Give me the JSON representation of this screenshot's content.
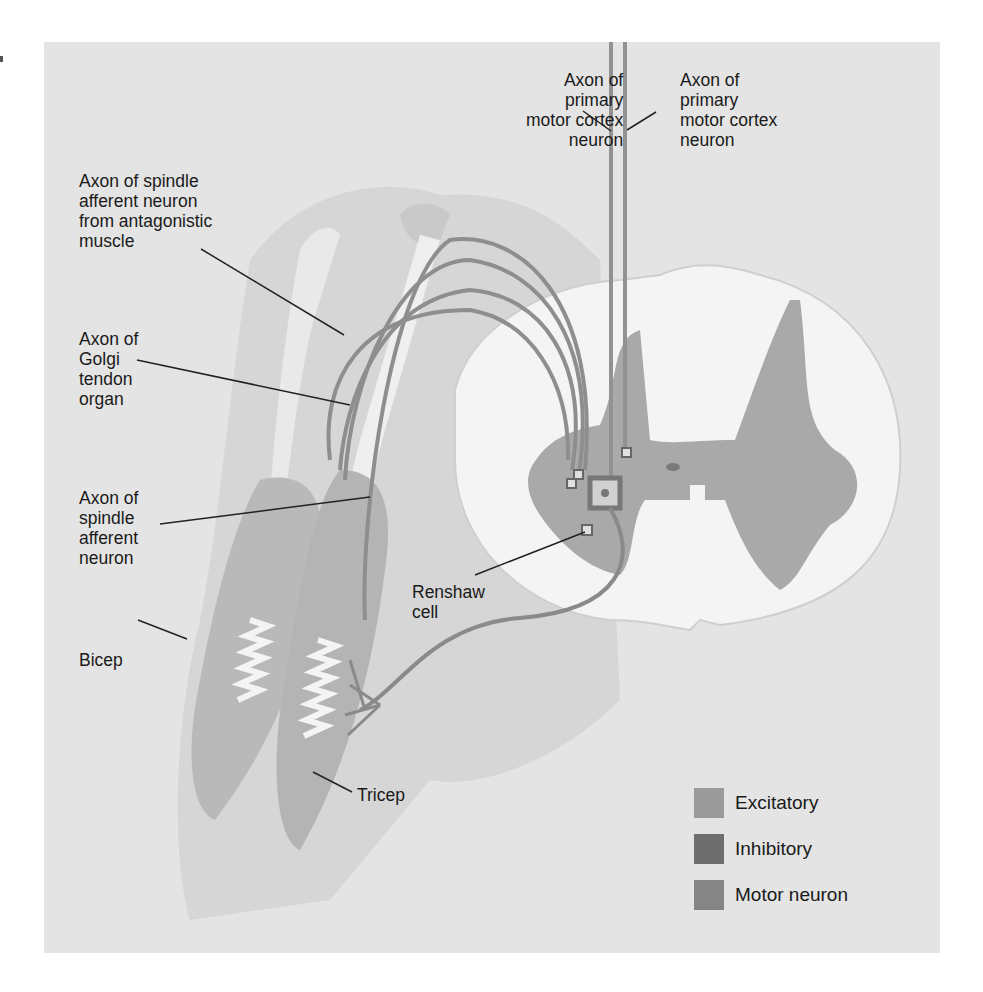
{
  "figure": {
    "background_color": "#e4e4e4"
  },
  "labels": {
    "axon_primary_left": "Axon of\nprimary\nmotor cortex\nneuron",
    "axon_primary_right": "Axon of\nprimary\nmotor cortex\nneuron",
    "spindle_antagonistic": "Axon of spindle\nafferent neuron\nfrom antagonistic\nmuscle",
    "golgi": "Axon of\nGolgi\ntendon\norgan",
    "spindle_afferent": "Axon of\nspindle\nafferent\nneuron",
    "bicep": "Bicep",
    "tricep": "Tricep",
    "renshaw": "Renshaw\ncell"
  },
  "legend": {
    "items": [
      {
        "label": "Excitatory",
        "color": "#9a9a9a"
      },
      {
        "label": "Inhibitory",
        "color": "#6e6e6e"
      },
      {
        "label": "Motor neuron",
        "color": "#858585"
      }
    ]
  }
}
